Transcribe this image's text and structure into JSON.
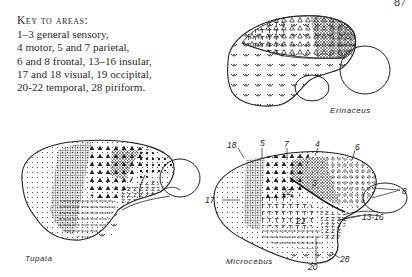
{
  "key": {
    "title": "Key to areas:",
    "lines": [
      "1–3 general sensory,",
      "4 motor, 5 and 7 parietal,",
      "6 and 8 frontal, 13–16 insular,",
      "17 and 18 visual, 19 occipital,",
      "20-22 temporal, 28 piriform."
    ]
  },
  "page_number": "87",
  "diagrams": {
    "erinaceus": {
      "label": "Erinaceus"
    },
    "tupaia": {
      "label": "Tupaia"
    },
    "microcebus": {
      "label": "Microcebus",
      "area_labels": [
        "18",
        "5",
        "7",
        "4",
        "6",
        "8",
        "17",
        "22",
        "3",
        "21",
        "13-16",
        "28",
        "20"
      ]
    }
  }
}
